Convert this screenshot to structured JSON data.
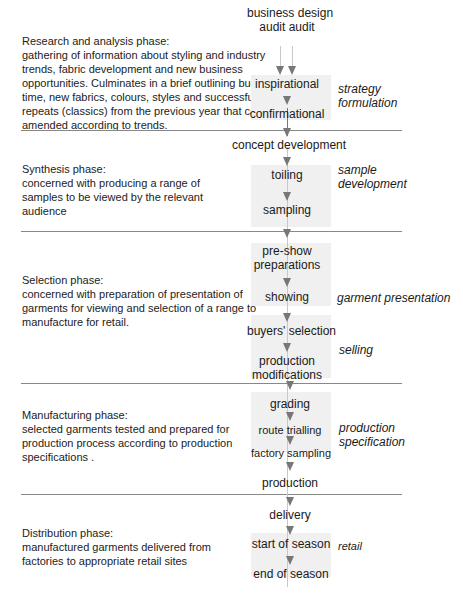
{
  "phases": [
    {
      "title": "Research and analysis phase:",
      "description": "gathering of information about styling and industry trends, fabric development and new business opportunities. Culminates in a brief outlining budget, time, new fabrics, colours, styles and successful repeats (classics) from the previous year that can be amended according to trends.",
      "lines": [
        "Research and analysis phase:",
        "gathering of information about styling and industry",
        "trends, fabric development and new business",
        "opportunities. Culminates in a brief outlining budget,",
        "time, new fabrics, colours, styles and successful",
        "repeats (classics) from the previous year that can be",
        "amended according to trends."
      ]
    },
    {
      "title": "Synthesis phase:",
      "lines": [
        "Synthesis phase:",
        "concerned with producing a range of",
        "samples to be viewed by the relevant",
        "audience"
      ]
    },
    {
      "title": "Selection phase:",
      "lines": [
        "Selection phase:",
        "concerned with preparation of presentation of",
        "garments for viewing and selection of a range to",
        "manufacture for retail."
      ]
    },
    {
      "title": "Manufacturing phase:",
      "lines": [
        "Manufacturing phase:",
        "selected garments tested and prepared for",
        "production process according to production",
        "specifications ."
      ]
    },
    {
      "title": "Distribution phase:",
      "lines": [
        "Distribution phase:",
        "manufactured garments delivered from",
        "factories to appropriate retail sites"
      ]
    }
  ],
  "nodes": {
    "business": "business",
    "design": "design",
    "audit1": "audit",
    "audit2": "audit",
    "inspirational": "inspirational",
    "confirmational": "confirmational",
    "concept_development": "concept development",
    "toiling": "toiling",
    "sampling": "sampling",
    "pre_show_1": "pre-show",
    "pre_show_2": "preparations",
    "showing": "showing",
    "buyers_selection": "buyers' selection",
    "production_mod_1": "production",
    "production_mod_2": "modifications",
    "grading": "grading",
    "route_trialling": "route trialling",
    "factory_sampling": "factory sampling",
    "production": "production",
    "delivery": "delivery",
    "start_of_season": "start of season",
    "end_of_season": "end of season"
  },
  "labels": {
    "strategy_1": "strategy",
    "strategy_2": "formulation",
    "sample_1": "sample",
    "sample_2": "development",
    "garment_presentation": "garment presentation",
    "selling": "selling",
    "production_spec_1": "production",
    "production_spec_2": "specification",
    "retail": "retail"
  },
  "colors": {
    "arrow": "#777777",
    "separator": "#888888",
    "shade": "#f0f0f0"
  }
}
